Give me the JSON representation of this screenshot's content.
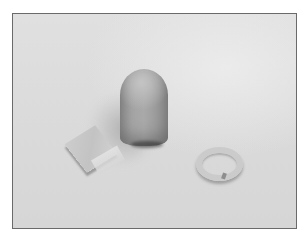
{
  "image": {
    "description": "Photograph of three modeling-clay objects on a light gray surface inside a thin dark frame",
    "frame_color": "#6a6a6a",
    "background_color": "#dcdcdc",
    "objects": [
      {
        "name": "flat square tile",
        "position": "left",
        "tone": "#c8c8c8"
      },
      {
        "name": "bullet-shaped cylinder",
        "position": "center",
        "tone": "#a2a2a2"
      },
      {
        "name": "coiled ring",
        "position": "right",
        "tone": "#cbcbcb"
      }
    ]
  }
}
